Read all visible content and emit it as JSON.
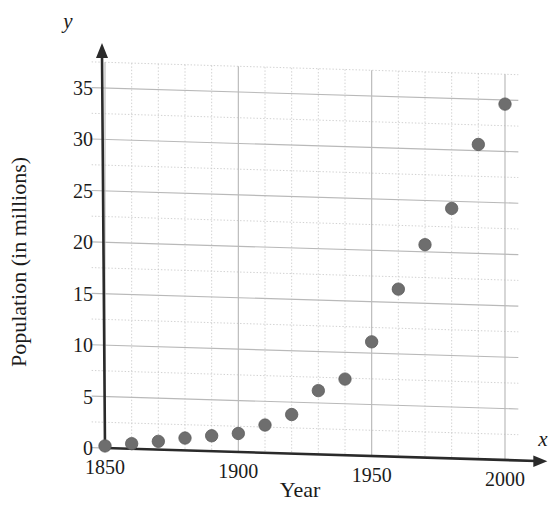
{
  "chart_data": {
    "type": "scatter",
    "title": "",
    "xlabel": "Year",
    "ylabel": "Population (in millions)",
    "x_axis_letter": "x",
    "y_axis_letter": "y",
    "xlim": [
      1845,
      2005
    ],
    "ylim": [
      0,
      37.5
    ],
    "x_ticks": [
      1850,
      1900,
      1950,
      2000
    ],
    "x_tick_labels": [
      "1850",
      "1900",
      "1950",
      "2000"
    ],
    "y_ticks": [
      0,
      5,
      10,
      15,
      20,
      25,
      30,
      35
    ],
    "y_tick_labels": [
      "0",
      "5",
      "10",
      "15",
      "20",
      "25",
      "30",
      "35"
    ],
    "x_gridline_step": 10,
    "y_gridline_step": 2.5,
    "grid": true,
    "legend": "none",
    "x": [
      1850,
      1860,
      1870,
      1880,
      1890,
      1900,
      1910,
      1920,
      1930,
      1940,
      1950,
      1960,
      1970,
      1980,
      1990,
      2000
    ],
    "values": [
      0.2,
      0.5,
      0.8,
      1.2,
      1.5,
      1.8,
      2.7,
      3.8,
      6.2,
      7.4,
      11.1,
      16.3,
      20.7,
      24.3,
      30.6,
      34.6
    ],
    "point_color": "#6e6e6e",
    "grid_color": "#c9c9c9",
    "axis_color": "#2a2a2a"
  }
}
